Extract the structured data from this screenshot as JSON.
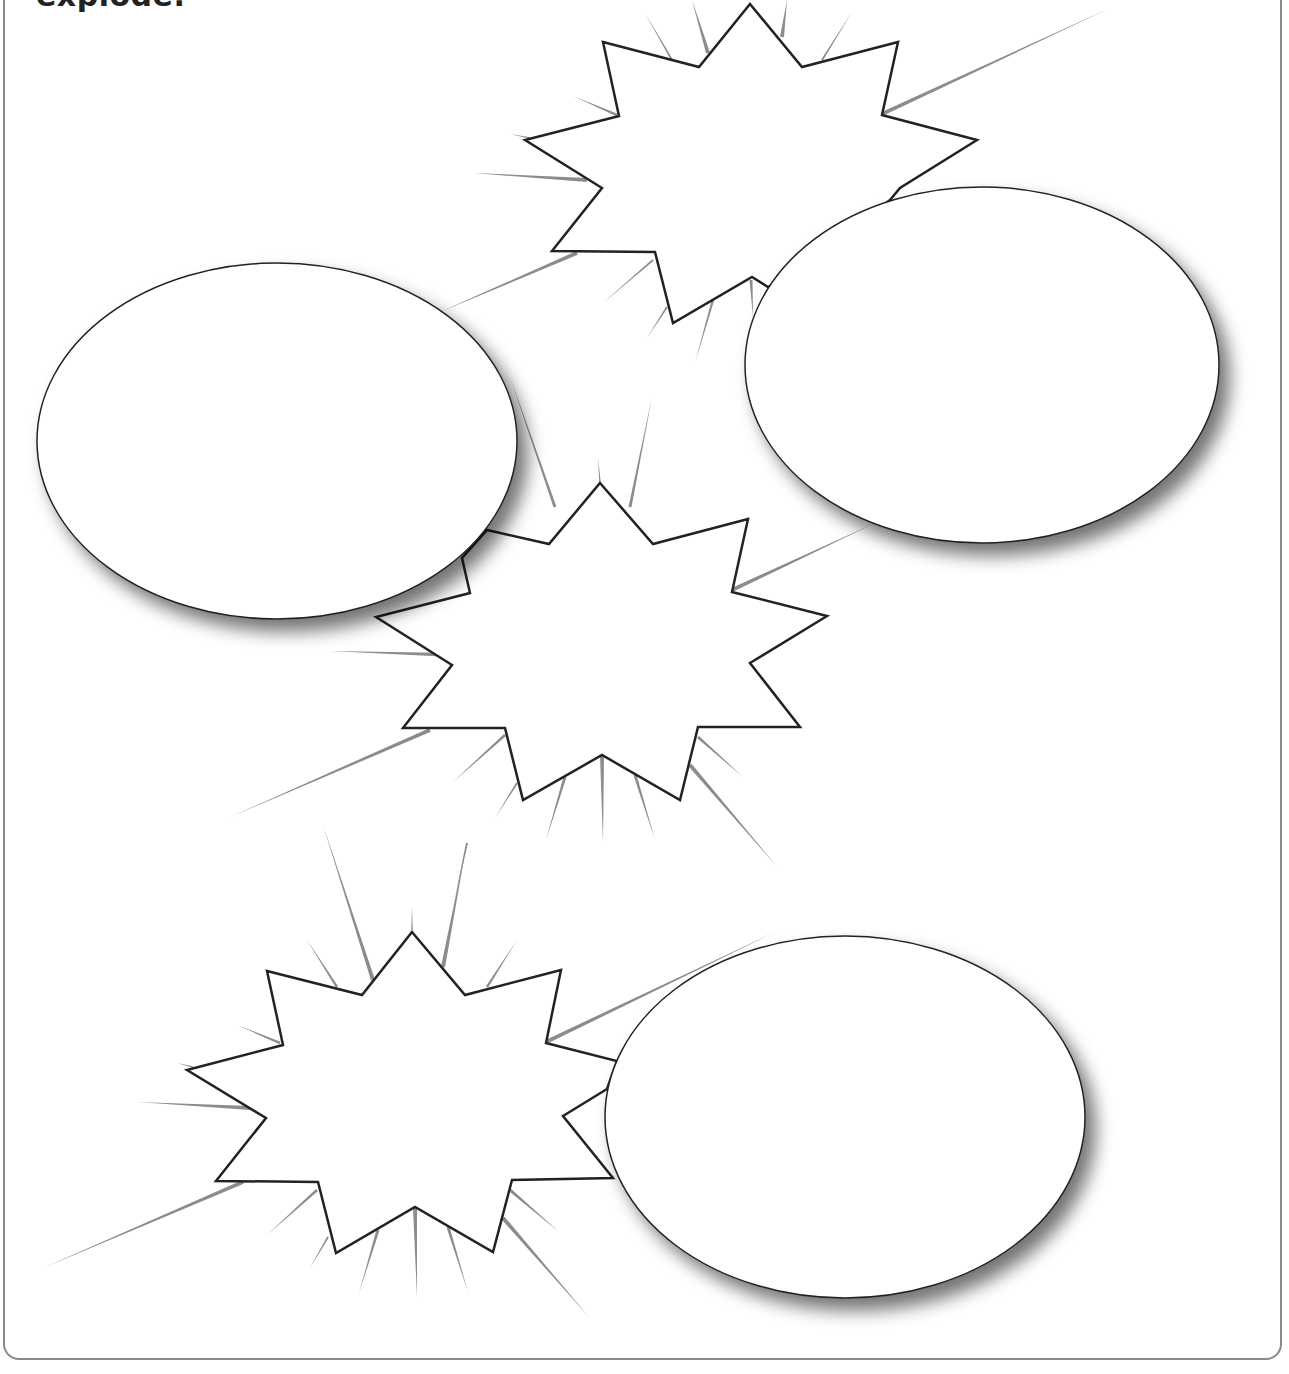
{
  "worksheet": {
    "instruction_text": "explode.",
    "frame_color": "#8a8a8a",
    "stroke_color": "#222222",
    "ray_color": "#8c8c8c",
    "shape_fill": "#ffffff"
  },
  "starbursts": [
    {
      "name": "top-starburst",
      "points": [
        [
          750,
          4
        ],
        [
          802,
          67
        ],
        [
          898,
          42
        ],
        [
          882,
          115
        ],
        [
          977,
          140
        ],
        [
          900,
          188
        ],
        [
          890,
          200
        ],
        [
          800,
          270
        ],
        [
          768,
          287
        ],
        [
          752,
          277
        ],
        [
          673,
          323
        ],
        [
          655,
          252
        ],
        [
          552,
          251
        ],
        [
          602,
          188
        ],
        [
          525,
          140
        ],
        [
          619,
          116
        ],
        [
          603,
          42
        ],
        [
          699,
          67
        ]
      ]
    },
    {
      "name": "middle-starburst",
      "points": [
        [
          600,
          483
        ],
        [
          653,
          544
        ],
        [
          748,
          519
        ],
        [
          732,
          592
        ],
        [
          827,
          616
        ],
        [
          750,
          663
        ],
        [
          800,
          727
        ],
        [
          698,
          727
        ],
        [
          680,
          800
        ],
        [
          602,
          755
        ],
        [
          523,
          800
        ],
        [
          505,
          728
        ],
        [
          403,
          728
        ],
        [
          452,
          665
        ],
        [
          376,
          617
        ],
        [
          470,
          593
        ],
        [
          462,
          558
        ],
        [
          487,
          530
        ],
        [
          549,
          544
        ]
      ]
    },
    {
      "name": "bottom-starburst",
      "points": [
        [
          412,
          932
        ],
        [
          465,
          995
        ],
        [
          561,
          970
        ],
        [
          546,
          1043
        ],
        [
          617,
          1061
        ],
        [
          607,
          1089
        ],
        [
          563,
          1116
        ],
        [
          613,
          1178
        ],
        [
          512,
          1180
        ],
        [
          493,
          1252
        ],
        [
          415,
          1207
        ],
        [
          336,
          1253
        ],
        [
          318,
          1182
        ],
        [
          216,
          1181
        ],
        [
          266,
          1118
        ],
        [
          187,
          1070
        ],
        [
          283,
          1045
        ],
        [
          267,
          971
        ],
        [
          362,
          995
        ]
      ]
    }
  ],
  "bubbles": [
    {
      "name": "left-speech-bubble",
      "cx": 277,
      "cy": 441,
      "rx": 240,
      "ry": 178
    },
    {
      "name": "right-speech-bubble",
      "cx": 982,
      "cy": 365,
      "rx": 237,
      "ry": 178
    },
    {
      "name": "bottom-speech-bubble",
      "cx": 845,
      "cy": 1117,
      "rx": 240,
      "ry": 181
    }
  ],
  "rays": [
    [
      [
        882,
        114
      ],
      [
        1110,
        8
      ],
      4
    ],
    [
      [
        577,
        253
      ],
      [
        440,
        312
      ],
      4
    ],
    [
      [
        653,
        260
      ],
      [
        603,
        303
      ],
      2
    ],
    [
      [
        667,
        307
      ],
      [
        647,
        338
      ],
      2
    ],
    [
      [
        713,
        300
      ],
      [
        695,
        363
      ],
      2.5
    ],
    [
      [
        751,
        280
      ],
      [
        753,
        317
      ],
      3
    ],
    [
      [
        555,
        507
      ],
      [
        510,
        377
      ],
      3
    ],
    [
      [
        630,
        507
      ],
      [
        652,
        397
      ],
      3
    ],
    [
      [
        600,
        482
      ],
      [
        598,
        458
      ],
      1.5
    ],
    [
      [
        708,
        53
      ],
      [
        692,
        0
      ],
      4
    ],
    [
      [
        672,
        60
      ],
      [
        645,
        13
      ],
      2
    ],
    [
      [
        782,
        37
      ],
      [
        787,
        0
      ],
      4
    ],
    [
      [
        822,
        60
      ],
      [
        852,
        12
      ],
      2
    ],
    [
      [
        587,
        180
      ],
      [
        473,
        173
      ],
      4
    ],
    [
      [
        617,
        115
      ],
      [
        573,
        96
      ],
      2.5
    ],
    [
      [
        530,
        138
      ],
      [
        510,
        134
      ],
      1.5
    ],
    [
      [
        732,
        590
      ],
      [
        873,
        524
      ],
      4
    ],
    [
      [
        452,
        655
      ],
      [
        330,
        651
      ],
      4
    ],
    [
      [
        430,
        730
      ],
      [
        228,
        818
      ],
      4
    ],
    [
      [
        602,
        755
      ],
      [
        603,
        843
      ],
      4
    ],
    [
      [
        565,
        777
      ],
      [
        546,
        840
      ],
      3
    ],
    [
      [
        635,
        775
      ],
      [
        655,
        840
      ],
      3
    ],
    [
      [
        505,
        735
      ],
      [
        453,
        782
      ],
      3
    ],
    [
      [
        517,
        783
      ],
      [
        495,
        818
      ],
      2
    ],
    [
      [
        698,
        737
      ],
      [
        743,
        777
      ],
      3
    ],
    [
      [
        690,
        765
      ],
      [
        778,
        868
      ],
      4
    ],
    [
      [
        467,
        843
      ],
      [
        455,
        898
      ],
      2
    ],
    [
      [
        373,
        980
      ],
      [
        323,
        825
      ],
      4
    ],
    [
      [
        443,
        967
      ],
      [
        467,
        842
      ],
      4
    ],
    [
      [
        337,
        987
      ],
      [
        307,
        940
      ],
      2.5
    ],
    [
      [
        487,
        987
      ],
      [
        517,
        940
      ],
      2.5
    ],
    [
      [
        412,
        930
      ],
      [
        412,
        907
      ],
      1.5
    ],
    [
      [
        243,
        1182
      ],
      [
        43,
        1268
      ],
      4
    ],
    [
      [
        250,
        1108
      ],
      [
        138,
        1102
      ],
      4
    ],
    [
      [
        280,
        1043
      ],
      [
        237,
        1025
      ],
      2.5
    ],
    [
      [
        193,
        1067
      ],
      [
        177,
        1063
      ],
      1.5
    ],
    [
      [
        317,
        1190
      ],
      [
        267,
        1235
      ],
      3
    ],
    [
      [
        328,
        1237
      ],
      [
        310,
        1268
      ],
      2
    ],
    [
      [
        415,
        1208
      ],
      [
        417,
        1297
      ],
      4
    ],
    [
      [
        378,
        1230
      ],
      [
        359,
        1293
      ],
      3
    ],
    [
      [
        448,
        1227
      ],
      [
        468,
        1292
      ],
      3
    ],
    [
      [
        510,
        1190
      ],
      [
        559,
        1232
      ],
      3
    ],
    [
      [
        503,
        1218
      ],
      [
        589,
        1317
      ],
      4
    ],
    [
      [
        546,
        1042
      ],
      [
        775,
        932
      ],
      4
    ]
  ]
}
